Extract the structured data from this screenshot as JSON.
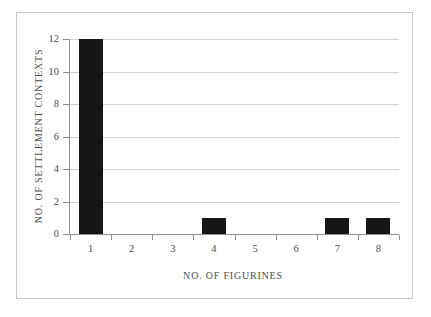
{
  "chart_data": {
    "type": "bar",
    "categories": [
      "1",
      "2",
      "3",
      "4",
      "5",
      "6",
      "7",
      "8"
    ],
    "values": [
      12,
      0,
      0,
      1,
      0,
      0,
      1,
      1
    ],
    "title": "",
    "xlabel": "NO. OF FIGURINES",
    "ylabel": "NO. OF SETTLEMENT CONTEXTS",
    "ylim": [
      0,
      12
    ],
    "ytick_step": 2,
    "yticks": [
      0,
      2,
      4,
      6,
      8,
      10,
      12
    ],
    "grid": "horizontal",
    "legend": "none",
    "colors": {
      "bar": "#161616",
      "gridline": "#d2d2d2",
      "axis": "#8f8f8f",
      "text": "#4d4d4d",
      "frame_border": "#c6c6c6",
      "background": "#ffffff"
    }
  }
}
